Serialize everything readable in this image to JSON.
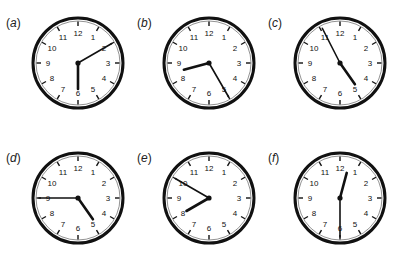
{
  "clocks": [
    {
      "label": "(a)",
      "letter": "a",
      "hour_hand_deg": 180,
      "minute_hand_deg": 60
    },
    {
      "label": "(b)",
      "letter": "b",
      "hour_hand_deg": 255,
      "minute_hand_deg": 150
    },
    {
      "label": "(c)",
      "letter": "c",
      "hour_hand_deg": 145,
      "minute_hand_deg": 333
    },
    {
      "label": "(d)",
      "letter": "d",
      "hour_hand_deg": 145,
      "minute_hand_deg": 270
    },
    {
      "label": "(e)",
      "letter": "e",
      "hour_hand_deg": 240,
      "minute_hand_deg": 300
    },
    {
      "label": "(f)",
      "letter": "f",
      "hour_hand_deg": 15,
      "minute_hand_deg": 180
    }
  ],
  "dial_numbers": [
    "12",
    "1",
    "2",
    "3",
    "4",
    "5",
    "6",
    "7",
    "8",
    "9",
    "10",
    "11"
  ]
}
